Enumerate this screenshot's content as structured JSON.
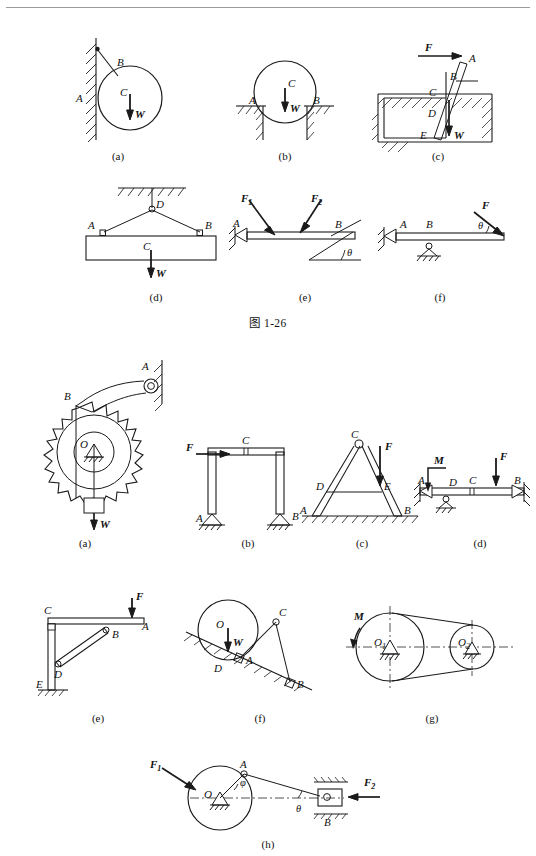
{
  "page": {
    "type": "textbook-figure-page",
    "top_rule": true,
    "background": "#ffffff",
    "ink": "#1a1a1a"
  },
  "group1": {
    "caption": "图 1-26",
    "figures": [
      {
        "key": "a",
        "label": "(a)",
        "description": "Cylinder resting against vertical hatched wall, held by cable to wall",
        "points": [
          "A",
          "B",
          "C"
        ],
        "forces": [
          "W"
        ],
        "point_A": "A",
        "point_B": "B",
        "point_C": "C",
        "force_W": "W"
      },
      {
        "key": "b",
        "label": "(b)",
        "description": "Cylinder resting in a groove between two hatched ledges",
        "points": [
          "A",
          "B",
          "C"
        ],
        "forces": [
          "W"
        ],
        "point_A": "A",
        "point_B": "B",
        "point_C": "C",
        "force_W": "W"
      },
      {
        "key": "c",
        "label": "(c)",
        "description": "Inclined bar inside a rectangular slot, pushed by horizontal force",
        "points": [
          "A",
          "B",
          "C",
          "D",
          "E"
        ],
        "forces": [
          "F",
          "W"
        ],
        "point_A": "A",
        "point_B": "B",
        "point_C": "C",
        "point_D": "D",
        "point_E": "E",
        "force_F": "F",
        "force_W": "W"
      },
      {
        "key": "d",
        "label": "(d)",
        "description": "Beam suspended by two cables from a ceiling hook",
        "points": [
          "A",
          "B",
          "C",
          "D"
        ],
        "forces": [
          "W"
        ],
        "point_A": "A",
        "point_B": "B",
        "point_C": "C",
        "point_D": "D",
        "force_W": "W"
      },
      {
        "key": "e",
        "label": "(e)",
        "description": "Beam with pin support at A and inclined roller at B, two applied loads",
        "points": [
          "A",
          "B"
        ],
        "forces": [
          "F1",
          "F2"
        ],
        "point_A": "A",
        "point_B": "B",
        "force_F1": "F",
        "force_F1_sub": "1",
        "force_F2": "F",
        "force_F2_sub": "2",
        "angle": "θ"
      },
      {
        "key": "f",
        "label": "(f)",
        "description": "Beam with pin at A, roller at B, inclined end force",
        "points": [
          "A",
          "B"
        ],
        "forces": [
          "F"
        ],
        "point_A": "A",
        "point_B": "B",
        "force_F": "F",
        "angle": "θ"
      }
    ]
  },
  "group2": {
    "caption": "",
    "figures": [
      {
        "key": "a",
        "label": "(a)",
        "description": "Ratchet wheel with pawl arm pinned to wall, hanging weight",
        "points": [
          "A",
          "B",
          "O"
        ],
        "forces": [
          "W"
        ],
        "point_A": "A",
        "point_B": "B",
        "point_O": "O",
        "force_W": "W"
      },
      {
        "key": "b",
        "label": "(b)",
        "description": "Portal frame with horizontal force at top-left, pinned bases",
        "points": [
          "A",
          "B",
          "C"
        ],
        "forces": [
          "F"
        ],
        "point_A": "A",
        "point_B": "B",
        "point_C": "C",
        "force_F": "F"
      },
      {
        "key": "c",
        "label": "(c)",
        "description": "Step ladder pinned at top C with tie bar DE, vertical load",
        "points": [
          "A",
          "B",
          "C",
          "D",
          "E"
        ],
        "forces": [
          "F"
        ],
        "point_A": "A",
        "point_B": "B",
        "point_C": "C",
        "point_D": "D",
        "point_E": "E",
        "force_F": "F"
      },
      {
        "key": "d",
        "label": "(d)",
        "description": "Compound beam with applied couple M, roller at D, hinge at C, load F",
        "points": [
          "A",
          "B",
          "C",
          "D"
        ],
        "forces": [
          "F"
        ],
        "moment": "M",
        "point_A": "A",
        "point_B": "B",
        "point_C": "C",
        "point_D": "D",
        "force_F": "F",
        "moment_M": "M"
      },
      {
        "key": "e",
        "label": "(e)",
        "description": "Wall bracket: vertical post EC, horizontal arm CA, diagonal brace DB",
        "points": [
          "A",
          "B",
          "C",
          "D",
          "E"
        ],
        "forces": [
          "F"
        ],
        "point_A": "A",
        "point_B": "B",
        "point_C": "C",
        "point_D": "D",
        "point_E": "E",
        "force_F": "F"
      },
      {
        "key": "f",
        "label": "(f)",
        "description": "Cylinder on inclined plane held by two-force links AC and CB",
        "points": [
          "A",
          "B",
          "C",
          "D",
          "O"
        ],
        "forces": [
          "W"
        ],
        "point_A": "A",
        "point_B": "B",
        "point_C": "C",
        "point_D": "D",
        "point_O": "O",
        "force_W": "W"
      },
      {
        "key": "g",
        "label": "(g)",
        "description": "Belt drive between two pinned pulleys, driving couple M",
        "points": [
          "O1",
          "O2"
        ],
        "moment": "M",
        "point_O1": "O",
        "point_O1_sub": "1",
        "point_O2": "O",
        "point_O2_sub": "2",
        "moment_M": "M"
      },
      {
        "key": "h",
        "label": "(h)",
        "description": "Crank-slider: disk pinned at O, crank pin A, rod to slider B in guide",
        "points": [
          "A",
          "B",
          "O"
        ],
        "forces": [
          "F1",
          "F2"
        ],
        "point_A": "A",
        "point_B": "B",
        "point_O": "O",
        "force_F1": "F",
        "force_F1_sub": "1",
        "force_F2": "F",
        "force_F2_sub": "2",
        "angle_phi": "φ",
        "angle_theta": "θ"
      }
    ]
  }
}
